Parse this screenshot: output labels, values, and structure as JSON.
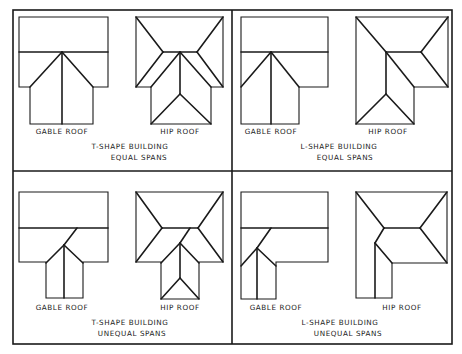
{
  "panels": [
    {
      "id": "t-equal",
      "building_label": "T-SHAPE BUILDING",
      "span_label": "EQUAL SPANS",
      "roofs": [
        {
          "type": "gable",
          "label": "GABLE ROOF"
        },
        {
          "type": "hip",
          "label": "HIP ROOF"
        }
      ]
    },
    {
      "id": "l-equal",
      "building_label": "L-SHAPE BUILDING",
      "span_label": "EQUAL SPANS",
      "roofs": [
        {
          "type": "gable",
          "label": "GABLE ROOF"
        },
        {
          "type": "hip",
          "label": "HIP ROOF"
        }
      ]
    },
    {
      "id": "t-unequal",
      "building_label": "T-SHAPE BUILDING",
      "span_label": "UNEQUAL SPANS",
      "roofs": [
        {
          "type": "gable",
          "label": "GABLE ROOF"
        },
        {
          "type": "hip",
          "label": "HIP ROOF"
        }
      ]
    },
    {
      "id": "l-unequal",
      "building_label": "L-SHAPE BUILDING",
      "span_label": "UNEQUAL SPANS",
      "roofs": [
        {
          "type": "gable",
          "label": "GABLE ROOF"
        },
        {
          "type": "hip",
          "label": "HIP ROOF"
        }
      ]
    }
  ]
}
